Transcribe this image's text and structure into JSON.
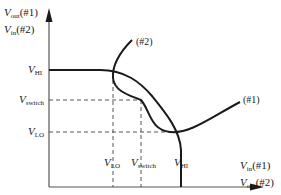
{
  "diagram": {
    "type": "voltage transfer characteristic (butterfly plot)",
    "y_axis": {
      "line1_var": "V",
      "line1_sub": "out",
      "line1_tag": "(#1)",
      "line2_var": "V",
      "line2_sub": "in",
      "line2_tag": "(#2)"
    },
    "x_axis": {
      "line1_var": "V",
      "line1_sub": "in",
      "line1_tag": "(#1)",
      "line2_var": "V",
      "line2_sub": "out",
      "line2_tag": "(#2)"
    },
    "y_ticks": [
      {
        "var": "V",
        "sub": "HI"
      },
      {
        "var": "V",
        "sub": "switch"
      },
      {
        "var": "V",
        "sub": "LO"
      }
    ],
    "x_ticks": [
      {
        "var": "V",
        "sub": "LO"
      },
      {
        "var": "V",
        "sub": "switch"
      },
      {
        "var": "V",
        "sub": "HI"
      }
    ],
    "curves": [
      {
        "label": "(#1)"
      },
      {
        "label": "(#2)"
      }
    ],
    "colors": {
      "line": "#1a1a1a",
      "background": "#ffffff"
    }
  }
}
